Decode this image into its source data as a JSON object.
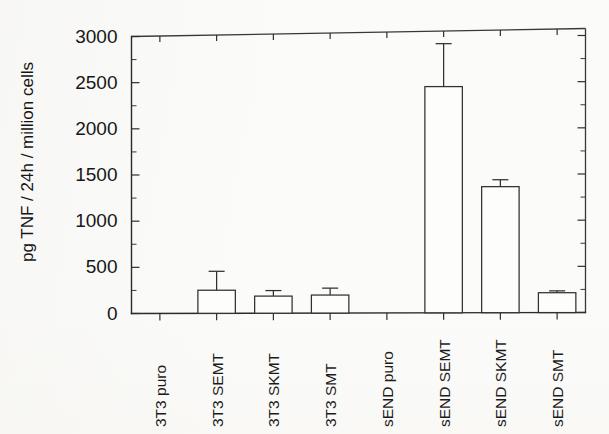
{
  "figure": {
    "background_color": "#fbfbfa",
    "line_color": "#303030",
    "bar_fill_color": "#fdfdfc"
  },
  "chart_data": {
    "type": "bar",
    "title": "",
    "xlabel": "",
    "ylabel": "pg TNF / 24h / million cells",
    "ylim": [
      0,
      3000
    ],
    "ytick_labels": [
      "0",
      "500",
      "1000",
      "1500",
      "2000",
      "2500",
      "3000"
    ],
    "ytick_values": [
      0,
      500,
      1000,
      1500,
      2000,
      2500,
      3000
    ],
    "minor_tick_interval": 250,
    "grid": false,
    "legend": false,
    "categories": [
      "3T3 puro",
      "3T3 SEMT",
      "3T3 SKMT",
      "3T3 SMT",
      "sEND puro",
      "sEND SEMT",
      "sEND SKMT",
      "sEND SMT"
    ],
    "values": [
      0,
      250,
      185,
      195,
      0,
      2450,
      1365,
      215
    ],
    "errors": [
      0,
      205,
      60,
      75,
      0,
      465,
      75,
      20
    ]
  }
}
